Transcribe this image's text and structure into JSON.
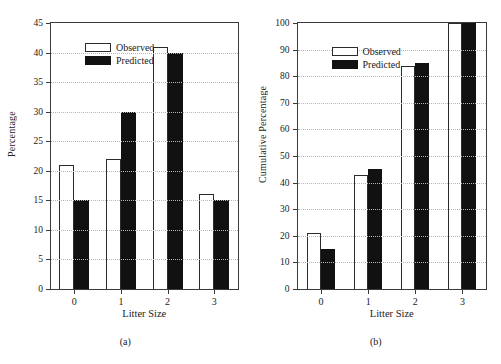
{
  "figure": {
    "background": "#ffffff",
    "series_colors": {
      "observed": "#ffffff",
      "predicted": "#111111",
      "outline": "#2b2b2b"
    }
  },
  "panels": [
    {
      "caption": "(a)",
      "chart_data": {
        "type": "bar",
        "title": "",
        "xlabel": "Litter Size",
        "ylabel": "Percentage",
        "categories": [
          "0",
          "1",
          "2",
          "3"
        ],
        "series": [
          {
            "name": "Observed",
            "values": [
              21,
              22,
              41,
              16
            ]
          },
          {
            "name": "Predicted",
            "values": [
              15,
              30,
              40,
              15
            ]
          }
        ],
        "ylim": [
          0,
          45
        ],
        "ytick_step": 5,
        "yticks": [
          0,
          5,
          10,
          15,
          20,
          25,
          30,
          35,
          40,
          45
        ],
        "grid": true,
        "legend_position": "upper-left"
      }
    },
    {
      "caption": "(b)",
      "chart_data": {
        "type": "bar",
        "title": "",
        "xlabel": "Litter Size",
        "ylabel": "Cumulative Percentage",
        "categories": [
          "0",
          "1",
          "2",
          "3"
        ],
        "series": [
          {
            "name": "Observed",
            "values": [
              21,
              43,
              84,
              100
            ]
          },
          {
            "name": "Predicted",
            "values": [
              15,
              45,
              85,
              100
            ]
          }
        ],
        "ylim": [
          0,
          100
        ],
        "ytick_step": 10,
        "yticks": [
          0,
          10,
          20,
          30,
          40,
          50,
          60,
          70,
          80,
          90,
          100
        ],
        "grid": true,
        "legend_position": "upper-left"
      }
    }
  ]
}
